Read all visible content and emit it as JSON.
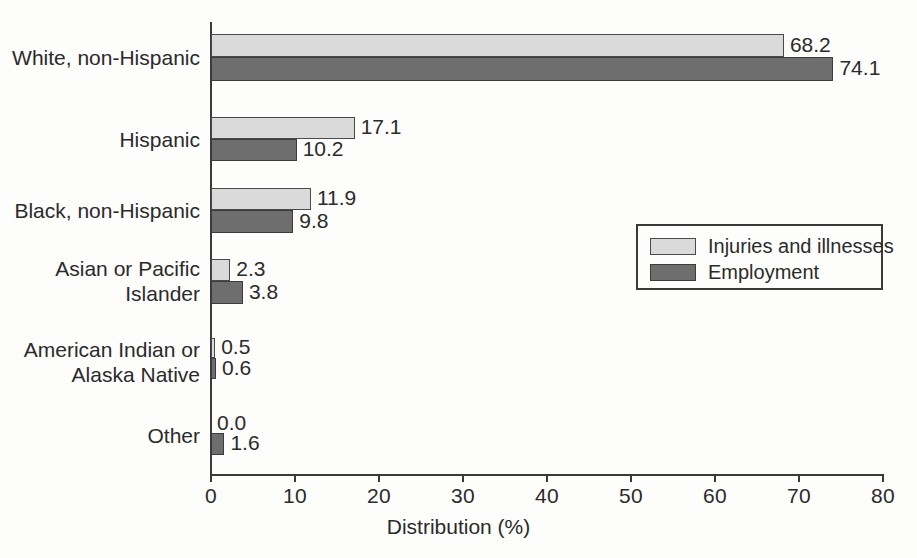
{
  "chart_data": {
    "type": "bar",
    "orientation": "horizontal",
    "title": "",
    "xlabel": "Distribution (%)",
    "ylabel": "",
    "xlim": [
      0,
      80
    ],
    "xticks": [
      0,
      10,
      20,
      30,
      40,
      50,
      60,
      70,
      80
    ],
    "xtick_labels": [
      "0",
      "10",
      "20",
      "30",
      "40",
      "50",
      "60",
      "70",
      "80"
    ],
    "grid": false,
    "legend_position": "center-right",
    "categories": [
      "White, non-Hispanic",
      "Hispanic",
      "Black, non-Hispanic",
      "Asian or Pacific\nIslander",
      "American Indian or\nAlaska Native",
      "Other"
    ],
    "series": [
      {
        "name": "Injuries and illnesses",
        "color": "#dadada",
        "values": [
          68.2,
          17.1,
          11.9,
          2.3,
          0.5,
          0.0
        ],
        "labels": [
          "68.2",
          "17.1",
          "11.9",
          "2.3",
          "0.5",
          "0.0"
        ]
      },
      {
        "name": "Employment",
        "color": "#6e6e6e",
        "values": [
          74.1,
          10.2,
          9.8,
          3.8,
          0.6,
          1.6
        ],
        "labels": [
          "74.1",
          "10.2",
          "9.8",
          "3.8",
          "0.6",
          "1.6"
        ]
      }
    ]
  },
  "legend": {
    "items": [
      {
        "label": "Injuries and illnesses",
        "swatch": "light"
      },
      {
        "label": "Employment",
        "swatch": "dark"
      }
    ]
  },
  "axis": {
    "x_title": "Distribution (%)"
  }
}
